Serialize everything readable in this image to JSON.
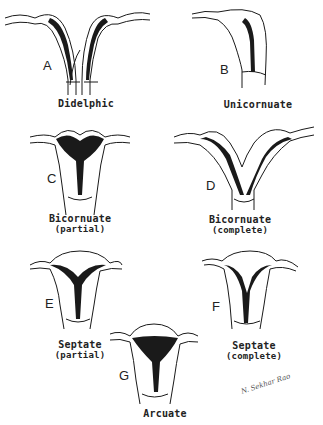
{
  "figures": [
    {
      "letter": "A",
      "name": "Didelphic",
      "qualifier": ""
    },
    {
      "letter": "B",
      "name": "Unicornuate",
      "qualifier": ""
    },
    {
      "letter": "C",
      "name": "Bicornuate",
      "qualifier": "(partial)"
    },
    {
      "letter": "D",
      "name": "Bicornuate",
      "qualifier": "(complete)"
    },
    {
      "letter": "E",
      "name": "Septate",
      "qualifier": "(partial)"
    },
    {
      "letter": "F",
      "name": "Septate",
      "qualifier": "(complete)"
    },
    {
      "letter": "G",
      "name": "Arcuate",
      "qualifier": ""
    }
  ],
  "signature": "N. Sekhar Rao",
  "colors": {
    "ink": "#1a1a1a",
    "background": "#ffffff"
  }
}
